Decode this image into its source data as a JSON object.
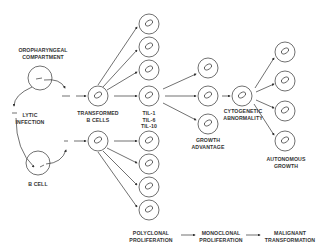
{
  "labels": {
    "oropharyngeal": [
      "OROPHARYNGEAL",
      "COMPARTMENT"
    ],
    "lytic": [
      "LYTIC",
      "INFECTION"
    ],
    "bcell": "B CELL",
    "transformed": [
      "TRANSFORMED",
      "B CELLS"
    ],
    "cytokines": [
      "TIL-1",
      "TIL-6",
      "TIL-10"
    ],
    "growth": [
      "GROWTH",
      "ADVANTAGE"
    ],
    "cytogenetic": [
      "CYTOGENETIC",
      "ABNORMALITY"
    ],
    "autonomous": [
      "AUTONOMOUS",
      "GROWTH"
    ],
    "stages": [
      [
        "POLYCLONAL",
        "PROLIFERATION"
      ],
      [
        "MONOCLONAL",
        "PROLIFERATION"
      ],
      [
        "MALIGNANT",
        "TRANSFORMATION"
      ]
    ]
  },
  "colors": {
    "line": "#333333",
    "text": "#333333"
  }
}
